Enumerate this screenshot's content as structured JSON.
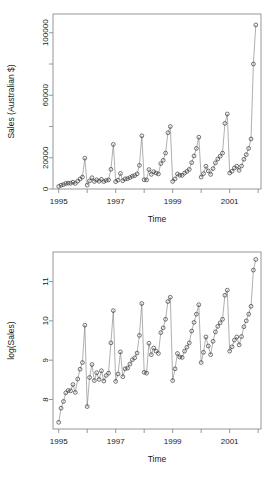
{
  "figure": {
    "type": "multi-panel-scatter-line",
    "panels": 2,
    "background": "#ffffff",
    "point_color": "#3a3a3a",
    "line_color": "#7a7a7a",
    "axis_color": "#8c8c8c"
  },
  "chart_data": [
    {
      "type": "line",
      "id": "sales-raw",
      "title": "",
      "xlabel": "Time",
      "ylabel": "Sales (Australian $)",
      "xlim": [
        1994.8,
        2002.1
      ],
      "ylim": [
        0,
        112000
      ],
      "xticks": [
        1995,
        1996,
        1997,
        1998,
        1999,
        2000,
        2001,
        2002
      ],
      "xticklabels": [
        "1995",
        "",
        "1997",
        "",
        "1999",
        "",
        "2001",
        ""
      ],
      "yticks": [
        0,
        20000,
        40000,
        60000,
        80000,
        100000
      ],
      "yticklabels": [
        "0",
        "20000",
        "",
        "60000",
        "",
        "100000"
      ],
      "grid": false,
      "legend": false,
      "marker": "open-circle",
      "x": [
        1995.0,
        1995.083,
        1995.167,
        1995.25,
        1995.333,
        1995.417,
        1995.5,
        1995.583,
        1995.667,
        1995.75,
        1995.833,
        1995.917,
        1996.0,
        1996.083,
        1996.167,
        1996.25,
        1996.333,
        1996.417,
        1996.5,
        1996.583,
        1996.667,
        1996.75,
        1996.833,
        1996.917,
        1997.0,
        1997.083,
        1997.167,
        1997.25,
        1997.333,
        1997.417,
        1997.5,
        1997.583,
        1997.667,
        1997.75,
        1997.833,
        1997.917,
        1998.0,
        1998.083,
        1998.167,
        1998.25,
        1998.333,
        1998.417,
        1998.5,
        1998.583,
        1998.667,
        1998.75,
        1998.833,
        1998.917,
        1999.0,
        1999.083,
        1999.167,
        1999.25,
        1999.333,
        1999.417,
        1999.5,
        1999.583,
        1999.667,
        1999.75,
        1999.833,
        1999.917,
        2000.0,
        2000.083,
        2000.167,
        2000.25,
        2000.333,
        2000.417,
        2000.5,
        2000.583,
        2000.667,
        2000.75,
        2000.833,
        2000.917,
        2001.0,
        2001.083,
        2001.167,
        2001.25,
        2001.333,
        2001.417,
        2001.5,
        2001.583,
        2001.667,
        2001.75,
        2001.833,
        2001.917
      ],
      "values": [
        1665,
        2398,
        2841,
        3547,
        3753,
        3715,
        4350,
        3566,
        5021,
        6423,
        7601,
        19756,
        2499,
        5198,
        7225,
        4806,
        5900,
        4951,
        6179,
        4752,
        5496,
        5835,
        12600,
        28542,
        4717,
        5702,
        9957,
        5304,
        6492,
        6630,
        7349,
        8176,
        8573,
        9690,
        15151,
        34061,
        5921,
        5814,
        12422,
        9363,
        11088,
        10234,
        9619,
        16243,
        18367,
        23000,
        36000,
        40000,
        4826,
        6470,
        9638,
        8821,
        8722,
        10209,
        11276,
        12552,
        16916,
        21165,
        26000,
        33151,
        7615,
        9849,
        14558,
        11587,
        9332,
        13082,
        16732,
        19181,
        21000,
        23000,
        42000,
        48000,
        10244,
        11392,
        13458,
        14603,
        11952,
        14729,
        19000,
        22000,
        26000,
        32000,
        80000,
        105000
      ]
    },
    {
      "type": "line",
      "id": "sales-log",
      "title": "",
      "xlabel": "Time",
      "ylabel": "log(Sales)",
      "xlim": [
        1994.8,
        2002.1
      ],
      "ylim": [
        7.25,
        11.75
      ],
      "xticks": [
        1995,
        1996,
        1997,
        1998,
        1999,
        2000,
        2001,
        2002
      ],
      "xticklabels": [
        "1995",
        "",
        "1997",
        "",
        "1999",
        "",
        "2001",
        ""
      ],
      "yticks": [
        8,
        9,
        10,
        11
      ],
      "yticklabels": [
        "8",
        "9",
        "10",
        "11"
      ],
      "grid": false,
      "legend": false,
      "marker": "open-circle",
      "x": [
        1995.0,
        1995.083,
        1995.167,
        1995.25,
        1995.333,
        1995.417,
        1995.5,
        1995.583,
        1995.667,
        1995.75,
        1995.833,
        1995.917,
        1996.0,
        1996.083,
        1996.167,
        1996.25,
        1996.333,
        1996.417,
        1996.5,
        1996.583,
        1996.667,
        1996.75,
        1996.833,
        1996.917,
        1997.0,
        1997.083,
        1997.167,
        1997.25,
        1997.333,
        1997.417,
        1997.5,
        1997.583,
        1997.667,
        1997.75,
        1997.833,
        1997.917,
        1998.0,
        1998.083,
        1998.167,
        1998.25,
        1998.333,
        1998.417,
        1998.5,
        1998.583,
        1998.667,
        1998.75,
        1998.833,
        1998.917,
        1999.0,
        1999.083,
        1999.167,
        1999.25,
        1999.333,
        1999.417,
        1999.5,
        1999.583,
        1999.667,
        1999.75,
        1999.833,
        1999.917,
        2000.0,
        2000.083,
        2000.167,
        2000.25,
        2000.333,
        2000.417,
        2000.5,
        2000.583,
        2000.667,
        2000.75,
        2000.833,
        2000.917,
        2001.0,
        2001.083,
        2001.167,
        2001.25,
        2001.333,
        2001.417,
        2001.5,
        2001.583,
        2001.667,
        2001.75,
        2001.833,
        2001.917
      ],
      "values": [
        7.42,
        7.78,
        7.95,
        8.17,
        8.23,
        8.22,
        8.38,
        8.18,
        8.52,
        8.77,
        8.94,
        9.89,
        7.82,
        8.56,
        8.89,
        8.48,
        8.68,
        8.51,
        8.73,
        8.47,
        8.61,
        8.67,
        9.44,
        10.26,
        8.46,
        8.65,
        9.21,
        8.58,
        8.78,
        8.8,
        8.9,
        9.01,
        9.06,
        9.18,
        9.63,
        10.44,
        8.69,
        8.67,
        9.43,
        9.14,
        9.31,
        9.23,
        9.17,
        9.7,
        9.82,
        10.04,
        10.49,
        10.6,
        8.48,
        8.78,
        9.17,
        9.08,
        9.07,
        9.23,
        9.33,
        9.44,
        9.74,
        9.96,
        10.17,
        10.41,
        8.94,
        9.2,
        9.59,
        9.36,
        9.14,
        9.48,
        9.72,
        9.86,
        9.95,
        10.04,
        10.65,
        10.78,
        9.23,
        9.34,
        9.51,
        9.59,
        9.39,
        9.6,
        9.85,
        10.0,
        10.17,
        10.37,
        11.29,
        11.56
      ]
    }
  ]
}
